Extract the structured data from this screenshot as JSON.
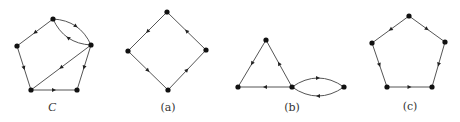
{
  "figure": {
    "width": 460,
    "height": 122,
    "colors": {
      "edge": "#555555",
      "node": "#111111",
      "arrow": "#222222",
      "label": "#333333"
    },
    "graphs": [
      {
        "id": "C",
        "label": "C",
        "label_style": "italic",
        "label_pos": [
          52,
          111
        ],
        "nodes": {
          "top": [
            53,
            19
          ],
          "left": [
            17,
            46
          ],
          "right": [
            91,
            45
          ],
          "bottom_left": [
            31,
            90
          ],
          "bottom_right": [
            77,
            90
          ]
        },
        "edges": [
          {
            "from": "top",
            "to": "left",
            "curve": 0
          },
          {
            "from": "top",
            "to": "right",
            "curve": -7
          },
          {
            "from": "right",
            "to": "top",
            "curve": -7
          },
          {
            "from": "left",
            "to": "bottom_left",
            "curve": 0
          },
          {
            "from": "right",
            "to": "bottom_left",
            "curve": 0
          },
          {
            "from": "bottom_left",
            "to": "bottom_right",
            "curve": 0
          },
          {
            "from": "right",
            "to": "bottom_right",
            "curve": 0
          }
        ]
      },
      {
        "id": "a",
        "label": "(a)",
        "label_style": "normal",
        "label_pos": [
          168,
          111
        ],
        "nodes": {
          "top": [
            167,
            12
          ],
          "left": [
            128,
            51
          ],
          "right": [
            206,
            50
          ],
          "bottom": [
            168,
            90
          ]
        },
        "edges": [
          {
            "from": "top",
            "to": "left",
            "curve": 0
          },
          {
            "from": "left",
            "to": "bottom",
            "curve": 0
          },
          {
            "from": "bottom",
            "to": "right",
            "curve": 0
          },
          {
            "from": "right",
            "to": "top",
            "curve": 0
          }
        ]
      },
      {
        "id": "b",
        "label": "(b)",
        "label_style": "normal",
        "label_pos": [
          292,
          111
        ],
        "nodes": {
          "top": [
            266,
            40
          ],
          "bottom_left": [
            238,
            87
          ],
          "bottom_right": [
            292,
            87
          ],
          "far_right": [
            344,
            87
          ]
        },
        "edges": [
          {
            "from": "top",
            "to": "bottom_left",
            "curve": 0
          },
          {
            "from": "bottom_right",
            "to": "top",
            "curve": 0
          },
          {
            "from": "bottom_right",
            "to": "bottom_left",
            "curve": 0
          },
          {
            "from": "far_right",
            "to": "bottom_right",
            "curve": -9
          },
          {
            "from": "bottom_right",
            "to": "far_right",
            "curve": -9
          }
        ]
      },
      {
        "id": "c",
        "label": "(c)",
        "label_style": "normal",
        "label_pos": [
          410,
          110
        ],
        "nodes": {
          "top": [
            409,
            16
          ],
          "left": [
            372,
            43
          ],
          "right": [
            445,
            42
          ],
          "bottom_left": [
            387,
            87
          ],
          "bottom_right": [
            432,
            87
          ]
        },
        "edges": [
          {
            "from": "top",
            "to": "left",
            "curve": 0
          },
          {
            "from": "top",
            "to": "right",
            "curve": 0
          },
          {
            "from": "left",
            "to": "bottom_left",
            "curve": 0
          },
          {
            "from": "bottom_left",
            "to": "bottom_right",
            "curve": 0
          },
          {
            "from": "right",
            "to": "bottom_right",
            "curve": 0
          }
        ]
      }
    ]
  }
}
